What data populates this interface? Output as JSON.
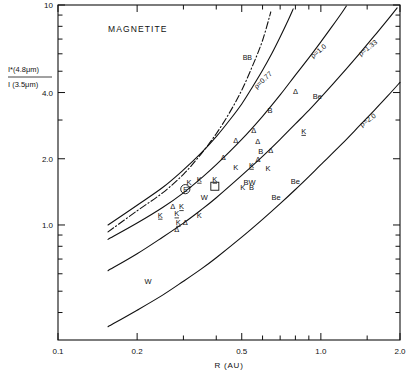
{
  "figure": {
    "title": "MAGNETITE",
    "xlabel": "R  (AU)",
    "ylabel_num": "I*(4.8μm)",
    "ylabel_den": "I (3.5μm)"
  },
  "chart_data": {
    "type": "line",
    "title": "MAGNETITE",
    "xlabel": "R (AU)",
    "ylabel": "I*(4.8μm) / I(3.5μm)",
    "xscale": "log",
    "yscale": "log",
    "xlim": [
      0.1,
      2.0
    ],
    "ylim": [
      0.3,
      10.0
    ],
    "grid": false,
    "legend": "inline-curve-labels",
    "xticks": [
      0.1,
      0.2,
      0.5,
      1.0,
      2.0
    ],
    "xticklabels": [
      "0.1",
      "0.2",
      "0.5",
      "1.0",
      "2.0"
    ],
    "xminor": [
      0.3,
      0.4,
      0.6,
      0.7,
      0.8,
      0.9,
      1.5
    ],
    "yticks": [
      1.0,
      2.0,
      4.0,
      10.0
    ],
    "yticklabels": [
      "1.0",
      "2.0",
      "4.0",
      "10"
    ],
    "yminor": [
      0.4,
      0.5,
      0.6,
      0.7,
      0.8,
      0.9,
      3.0,
      5.0,
      6.0,
      7.0,
      8.0,
      9.0
    ],
    "series": [
      {
        "name": "BB",
        "label": "BB",
        "style": "dash-dot",
        "points": [
          [
            0.155,
            0.93
          ],
          [
            0.2,
            1.16
          ],
          [
            0.25,
            1.4
          ],
          [
            0.3,
            1.7
          ],
          [
            0.35,
            2.1
          ],
          [
            0.4,
            2.6
          ],
          [
            0.45,
            3.25
          ],
          [
            0.5,
            4.1
          ],
          [
            0.55,
            5.3
          ],
          [
            0.6,
            6.9
          ],
          [
            0.645,
            9.3
          ]
        ]
      },
      {
        "name": "rho=0.77",
        "label": "ρ=0.77",
        "style": "solid",
        "points": [
          [
            0.155,
            1.0
          ],
          [
            0.2,
            1.23
          ],
          [
            0.25,
            1.48
          ],
          [
            0.3,
            1.78
          ],
          [
            0.35,
            2.12
          ],
          [
            0.4,
            2.52
          ],
          [
            0.45,
            3.0
          ],
          [
            0.5,
            3.55
          ],
          [
            0.55,
            4.25
          ],
          [
            0.6,
            5.05
          ],
          [
            0.65,
            6.0
          ],
          [
            0.7,
            7.15
          ],
          [
            0.75,
            8.5
          ],
          [
            0.785,
            9.6
          ]
        ]
      },
      {
        "name": "rho=1.0",
        "label": "ρ=1.0",
        "style": "solid",
        "points": [
          [
            0.155,
            0.86
          ],
          [
            0.2,
            1.02
          ],
          [
            0.25,
            1.2
          ],
          [
            0.3,
            1.4
          ],
          [
            0.35,
            1.63
          ],
          [
            0.4,
            1.88
          ],
          [
            0.5,
            2.45
          ],
          [
            0.6,
            3.12
          ],
          [
            0.7,
            3.9
          ],
          [
            0.8,
            4.8
          ],
          [
            0.9,
            5.75
          ],
          [
            1.0,
            6.8
          ],
          [
            1.1,
            7.95
          ],
          [
            1.2,
            9.2
          ],
          [
            1.25,
            9.9
          ]
        ]
      },
      {
        "name": "rho=1.33",
        "label": "ρ=1.33",
        "style": "solid",
        "points": [
          [
            0.155,
            0.62
          ],
          [
            0.2,
            0.74
          ],
          [
            0.25,
            0.88
          ],
          [
            0.3,
            1.02
          ],
          [
            0.35,
            1.17
          ],
          [
            0.4,
            1.33
          ],
          [
            0.5,
            1.68
          ],
          [
            0.6,
            2.05
          ],
          [
            0.7,
            2.45
          ],
          [
            0.8,
            2.88
          ],
          [
            0.9,
            3.32
          ],
          [
            1.0,
            3.8
          ],
          [
            1.2,
            4.85
          ],
          [
            1.4,
            6.0
          ],
          [
            1.6,
            7.25
          ],
          [
            1.8,
            8.6
          ],
          [
            1.95,
            9.7
          ]
        ]
      },
      {
        "name": "rho=2.0",
        "label": "ρ=2.0",
        "style": "solid",
        "points": [
          [
            0.155,
            0.345
          ],
          [
            0.2,
            0.41
          ],
          [
            0.25,
            0.48
          ],
          [
            0.3,
            0.555
          ],
          [
            0.35,
            0.63
          ],
          [
            0.4,
            0.71
          ],
          [
            0.5,
            0.88
          ],
          [
            0.6,
            1.06
          ],
          [
            0.7,
            1.25
          ],
          [
            0.8,
            1.45
          ],
          [
            0.9,
            1.66
          ],
          [
            1.0,
            1.88
          ],
          [
            1.2,
            2.33
          ],
          [
            1.4,
            2.82
          ],
          [
            1.6,
            3.33
          ],
          [
            1.8,
            3.87
          ],
          [
            2.0,
            4.45
          ]
        ]
      }
    ],
    "annotations": [
      {
        "text": "Δ",
        "x": 0.8,
        "y": 4.08,
        "kind": "triangle"
      },
      {
        "text": "Be",
        "x": 0.97,
        "y": 3.85,
        "kind": "letter"
      },
      {
        "text": "B",
        "x": 0.64,
        "y": 3.32,
        "kind": "letter"
      },
      {
        "text": "Δ",
        "x": 0.555,
        "y": 2.7,
        "kind": "triangle"
      },
      {
        "text": "K",
        "x": 0.86,
        "y": 2.68,
        "kind": "letter-underline"
      },
      {
        "text": "Δ",
        "x": 0.475,
        "y": 2.44,
        "kind": "triangle"
      },
      {
        "text": "Δ",
        "x": 0.575,
        "y": 2.41,
        "kind": "triangle"
      },
      {
        "text": "B",
        "x": 0.59,
        "y": 2.18,
        "kind": "letter"
      },
      {
        "text": "Δ",
        "x": 0.645,
        "y": 2.19,
        "kind": "triangle"
      },
      {
        "text": "Δ",
        "x": 0.425,
        "y": 2.03,
        "kind": "triangle"
      },
      {
        "text": "Δ",
        "x": 0.577,
        "y": 1.99,
        "kind": "triangle"
      },
      {
        "text": "K",
        "x": 0.545,
        "y": 1.88,
        "kind": "letter-underline"
      },
      {
        "text": "K",
        "x": 0.475,
        "y": 1.83,
        "kind": "letter"
      },
      {
        "text": "K",
        "x": 0.63,
        "y": 1.81,
        "kind": "letter"
      },
      {
        "text": "K",
        "x": 0.345,
        "y": 1.625,
        "kind": "letter-underline"
      },
      {
        "text": "K",
        "x": 0.395,
        "y": 1.625,
        "kind": "letter-underline"
      },
      {
        "text": "K",
        "x": 0.315,
        "y": 1.56,
        "kind": "letter-underline"
      },
      {
        "text": "BW",
        "x": 0.535,
        "y": 1.575,
        "kind": "letter"
      },
      {
        "text": "Be",
        "x": 0.8,
        "y": 1.59,
        "kind": "letter"
      },
      {
        "text": "K",
        "x": 0.505,
        "y": 1.49,
        "kind": "letter"
      },
      {
        "text": "B",
        "x": 0.545,
        "y": 1.49,
        "kind": "letter"
      },
      {
        "text": "⊕",
        "x": 0.305,
        "y": 1.455,
        "kind": "earth-symbol"
      },
      {
        "text": "□",
        "x": 0.395,
        "y": 1.5,
        "kind": "square-symbol"
      },
      {
        "text": "W",
        "x": 0.36,
        "y": 1.335,
        "kind": "letter"
      },
      {
        "text": "Be",
        "x": 0.675,
        "y": 1.345,
        "kind": "letter"
      },
      {
        "text": "Δ",
        "x": 0.273,
        "y": 1.225,
        "kind": "triangle"
      },
      {
        "text": "K",
        "x": 0.295,
        "y": 1.22,
        "kind": "letter-underline"
      },
      {
        "text": "K",
        "x": 0.245,
        "y": 1.115,
        "kind": "letter-underline"
      },
      {
        "text": "K",
        "x": 0.283,
        "y": 1.13,
        "kind": "letter-underline"
      },
      {
        "text": "K",
        "x": 0.345,
        "y": 1.115,
        "kind": "letter"
      },
      {
        "text": "K",
        "x": 0.287,
        "y": 1.035,
        "kind": "letter-underline"
      },
      {
        "text": "Δ",
        "x": 0.305,
        "y": 1.03,
        "kind": "triangle"
      },
      {
        "text": "Δ",
        "x": 0.283,
        "y": 0.955,
        "kind": "triangle"
      },
      {
        "text": "W",
        "x": 0.22,
        "y": 0.555,
        "kind": "letter"
      }
    ]
  }
}
